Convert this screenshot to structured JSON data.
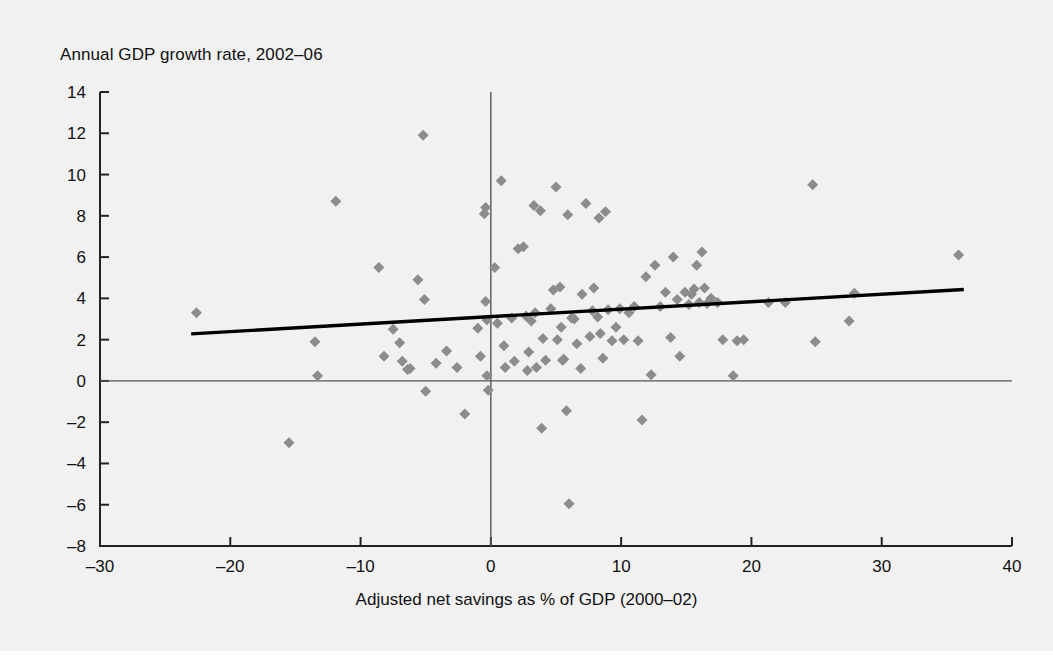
{
  "figure": {
    "background_color": "#f1f1f1",
    "page_background": "#ffffff",
    "title": "Annual GDP growth rate, 2002–06",
    "xaxis_title": "Adjusted net savings as % of GDP (2000–02)"
  },
  "chart_data": {
    "type": "scatter",
    "title": "Annual GDP growth rate, 2002–06",
    "xlabel": "Adjusted net savings as % of GDP (2000–02)",
    "ylabel": "Annual GDP growth rate, 2002–06",
    "xlim": [
      -30,
      40
    ],
    "ylim": [
      -8,
      14
    ],
    "xticks": [
      -30,
      -20,
      -10,
      0,
      10,
      20,
      30,
      40
    ],
    "yticks": [
      -8,
      -6,
      -4,
      -2,
      0,
      2,
      4,
      6,
      8,
      10,
      12,
      14
    ],
    "xtick_labels": [
      "–30",
      "–20",
      "–10",
      "0",
      "10",
      "20",
      "30",
      "40"
    ],
    "ytick_labels": [
      "–8",
      "–6",
      "–4",
      "–2",
      "0",
      "2",
      "4",
      "6",
      "8",
      "10",
      "12",
      "14"
    ],
    "grid": false,
    "legend": null,
    "marker": {
      "shape": "diamond",
      "color": "#8c8c8c",
      "size": 11
    },
    "reference_lines": [
      {
        "name": "zero-horizontal",
        "orientation": "horizontal",
        "value": 0,
        "color": "#555555"
      },
      {
        "name": "zero-vertical",
        "orientation": "vertical",
        "value": 0,
        "color": "#555555"
      }
    ],
    "trendline": {
      "name": "linear-fit",
      "color": "#000000",
      "width": 3.4,
      "x_start": -23.0,
      "y_start": 2.28,
      "x_end": 36.3,
      "y_end": 4.43
    },
    "points": [
      [
        -22.6,
        3.3
      ],
      [
        -15.5,
        -3.0
      ],
      [
        -13.5,
        1.9
      ],
      [
        -13.3,
        0.25
      ],
      [
        -11.9,
        8.7
      ],
      [
        -8.6,
        5.5
      ],
      [
        -8.2,
        1.2
      ],
      [
        -7.5,
        2.5
      ],
      [
        -7.0,
        1.85
      ],
      [
        -6.8,
        0.95
      ],
      [
        -6.4,
        0.55
      ],
      [
        -6.2,
        0.6
      ],
      [
        -5.6,
        4.9
      ],
      [
        -5.2,
        11.9
      ],
      [
        -5.1,
        3.95
      ],
      [
        -5.0,
        -0.5
      ],
      [
        -4.2,
        0.85
      ],
      [
        -3.4,
        1.45
      ],
      [
        -2.6,
        0.65
      ],
      [
        -2.0,
        -1.6
      ],
      [
        -1.0,
        2.55
      ],
      [
        -0.8,
        1.2
      ],
      [
        -0.5,
        8.1
      ],
      [
        -0.4,
        8.4
      ],
      [
        -0.4,
        3.85
      ],
      [
        -0.3,
        2.95
      ],
      [
        -0.3,
        0.25
      ],
      [
        -0.2,
        -0.45
      ],
      [
        0.3,
        5.5
      ],
      [
        0.5,
        2.8
      ],
      [
        0.8,
        9.7
      ],
      [
        1.0,
        1.7
      ],
      [
        1.1,
        0.65
      ],
      [
        1.6,
        3.05
      ],
      [
        1.8,
        0.95
      ],
      [
        2.1,
        6.4
      ],
      [
        2.5,
        6.5
      ],
      [
        2.7,
        3.15
      ],
      [
        2.8,
        0.5
      ],
      [
        2.9,
        1.4
      ],
      [
        3.1,
        2.9
      ],
      [
        3.3,
        8.5
      ],
      [
        3.4,
        3.3
      ],
      [
        3.5,
        0.65
      ],
      [
        3.8,
        8.25
      ],
      [
        3.9,
        -2.3
      ],
      [
        4.0,
        2.05
      ],
      [
        4.2,
        1.0
      ],
      [
        4.6,
        3.5
      ],
      [
        4.8,
        4.4
      ],
      [
        5.0,
        9.4
      ],
      [
        5.1,
        2.0
      ],
      [
        5.3,
        4.55
      ],
      [
        5.4,
        2.6
      ],
      [
        5.5,
        1.0
      ],
      [
        5.6,
        1.05
      ],
      [
        5.8,
        -1.45
      ],
      [
        5.9,
        8.05
      ],
      [
        6.0,
        -5.95
      ],
      [
        6.2,
        3.05
      ],
      [
        6.4,
        3.0
      ],
      [
        6.6,
        1.8
      ],
      [
        6.9,
        0.6
      ],
      [
        7.0,
        4.2
      ],
      [
        7.3,
        8.6
      ],
      [
        7.6,
        2.15
      ],
      [
        7.8,
        3.4
      ],
      [
        7.9,
        4.5
      ],
      [
        8.2,
        3.1
      ],
      [
        8.3,
        7.9
      ],
      [
        8.4,
        2.3
      ],
      [
        8.6,
        1.1
      ],
      [
        8.8,
        8.2
      ],
      [
        9.0,
        3.45
      ],
      [
        9.3,
        1.95
      ],
      [
        9.6,
        2.6
      ],
      [
        9.9,
        3.5
      ],
      [
        10.2,
        2.0
      ],
      [
        10.6,
        3.3
      ],
      [
        11.0,
        3.6
      ],
      [
        11.3,
        1.95
      ],
      [
        11.6,
        -1.9
      ],
      [
        11.9,
        5.05
      ],
      [
        12.3,
        0.3
      ],
      [
        12.6,
        5.6
      ],
      [
        13.0,
        3.6
      ],
      [
        13.4,
        4.3
      ],
      [
        13.8,
        2.1
      ],
      [
        14.0,
        6.0
      ],
      [
        14.3,
        3.95
      ],
      [
        14.5,
        1.2
      ],
      [
        14.9,
        4.3
      ],
      [
        15.2,
        3.7
      ],
      [
        15.4,
        4.2
      ],
      [
        15.6,
        4.45
      ],
      [
        15.8,
        5.6
      ],
      [
        16.0,
        3.8
      ],
      [
        16.2,
        6.25
      ],
      [
        16.4,
        4.5
      ],
      [
        16.6,
        3.75
      ],
      [
        16.9,
        4.0
      ],
      [
        17.4,
        3.8
      ],
      [
        17.8,
        2.0
      ],
      [
        18.6,
        0.25
      ],
      [
        18.9,
        1.95
      ],
      [
        19.4,
        2.0
      ],
      [
        21.3,
        3.8
      ],
      [
        22.6,
        3.8
      ],
      [
        24.7,
        9.5
      ],
      [
        24.9,
        1.9
      ],
      [
        27.5,
        2.9
      ],
      [
        27.9,
        4.25
      ],
      [
        35.9,
        6.1
      ]
    ]
  }
}
